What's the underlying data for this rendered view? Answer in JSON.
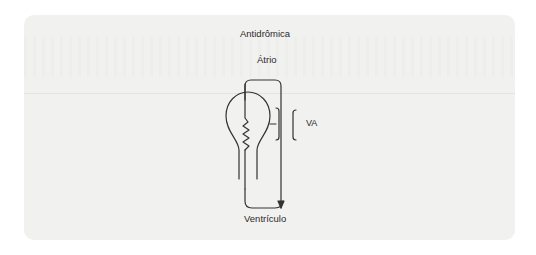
{
  "diagram": {
    "title": "Antidrômica",
    "top_label": "Átrio",
    "bottom_label": "Ventrículo",
    "pathway_label": "VA",
    "colors": {
      "page_background": "#ffffff",
      "panel_background": "#f1f1f0",
      "stroke": "#333333",
      "text": "#2a2a2a"
    },
    "nodes": [
      {
        "id": "atrium",
        "label": "Átrio"
      },
      {
        "id": "av-node",
        "label": "",
        "shape": "bulb-with-zigzag"
      },
      {
        "id": "accessory-pathway",
        "label": "VA"
      },
      {
        "id": "ventricle",
        "label": "Ventrículo"
      }
    ],
    "edges": [
      {
        "from": "atrium",
        "to": "ventricle",
        "via": "accessory-pathway",
        "direction": "anterograde",
        "arrow": "down"
      },
      {
        "from": "ventricle",
        "to": "atrium",
        "via": "av-node",
        "direction": "retrograde"
      }
    ]
  }
}
